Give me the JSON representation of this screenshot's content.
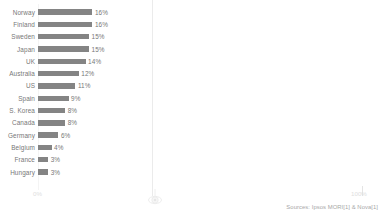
{
  "chart_data": {
    "type": "bar",
    "orientation": "horizontal",
    "title": "",
    "subtitle": "",
    "xlabel": "",
    "ylabel": "",
    "xlim": [
      0,
      100
    ],
    "grid": false,
    "legend": null,
    "bar_color": "#848484",
    "categories": [
      "Norway",
      "Finland",
      "Sweden",
      "Japan",
      "UK",
      "Australia",
      "US",
      "Spain",
      "S. Korea",
      "Canada",
      "Germany",
      "Belgium",
      "France",
      "Hungary"
    ],
    "values": [
      16,
      16,
      15,
      15,
      14,
      12,
      11,
      9,
      8,
      8,
      6,
      4,
      3,
      3
    ],
    "value_labels": [
      "16%",
      "16%",
      "15%",
      "15%",
      "14%",
      "12%",
      "11%",
      "9%",
      "8%",
      "8%",
      "6%",
      "4%",
      "3%",
      "3%"
    ],
    "x_tick_labels": [
      "0%",
      "100%"
    ],
    "annotations": [
      "Sources: Ipsos MORI[1] & Nova[1]"
    ]
  },
  "axis": {
    "tick_min": "0%",
    "tick_max": "100%"
  },
  "footer": {
    "source": "Sources: Ipsos MORI[1] & Nova[1]"
  },
  "icons": {
    "watermark": "watermark-logo-icon"
  }
}
